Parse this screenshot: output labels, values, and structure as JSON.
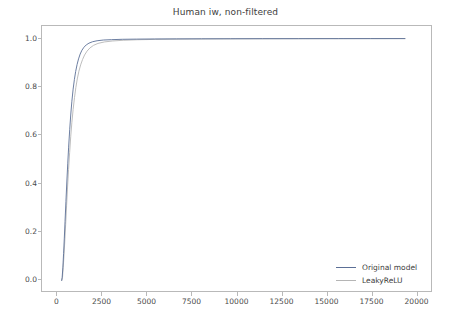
{
  "chart_data": {
    "type": "line",
    "title": "Human iw, non-filtered",
    "xlabel": "",
    "ylabel": "",
    "xlim": [
      -860,
      20860
    ],
    "ylim": [
      -0.052,
      1.052
    ],
    "grid": false,
    "legend_position": "lower right",
    "xticks": [
      0,
      2500,
      5000,
      7500,
      10000,
      12500,
      15000,
      17500,
      20000
    ],
    "xtick_labels": [
      "0",
      "2500",
      "5000",
      "7500",
      "10000",
      "12500",
      "15000",
      "17500",
      "20000"
    ],
    "yticks": [
      0.0,
      0.2,
      0.4,
      0.6,
      0.8,
      1.0
    ],
    "ytick_labels": [
      "0.0",
      "0.2",
      "0.4",
      "0.6",
      "0.8",
      "1.0"
    ],
    "series": [
      {
        "name": "Original model",
        "color": "#5b6f96",
        "x": [
          230,
          260,
          300,
          340,
          380,
          420,
          470,
          520,
          570,
          620,
          680,
          740,
          800,
          870,
          940,
          1010,
          1090,
          1170,
          1260,
          1360,
          1470,
          1600,
          1750,
          1950,
          2200,
          2550,
          3000,
          3600,
          4400,
          5400,
          6600,
          8000,
          9600,
          11400,
          13400,
          15600,
          17400,
          19300
        ],
        "y": [
          0.0,
          0.012,
          0.055,
          0.112,
          0.175,
          0.243,
          0.327,
          0.407,
          0.482,
          0.551,
          0.625,
          0.688,
          0.741,
          0.791,
          0.831,
          0.864,
          0.893,
          0.916,
          0.936,
          0.952,
          0.964,
          0.974,
          0.981,
          0.987,
          0.991,
          0.994,
          0.9955,
          0.997,
          0.9978,
          0.9984,
          0.9988,
          0.9991,
          0.9994,
          0.9996,
          0.9997,
          0.9998,
          0.9999,
          1.0
        ]
      },
      {
        "name": "LeakyReLU",
        "color": "#b5b5b5",
        "x": [
          245,
          280,
          320,
          365,
          410,
          455,
          505,
          560,
          615,
          675,
          735,
          800,
          870,
          945,
          1020,
          1100,
          1190,
          1285,
          1390,
          1505,
          1640,
          1800,
          2000,
          2250,
          2600,
          3050,
          3650,
          4450,
          5450,
          6700,
          8200,
          9900,
          11800,
          13800,
          15900,
          17600,
          19300
        ],
        "y": [
          0.0,
          0.014,
          0.054,
          0.108,
          0.168,
          0.232,
          0.308,
          0.386,
          0.458,
          0.528,
          0.594,
          0.654,
          0.707,
          0.756,
          0.797,
          0.833,
          0.865,
          0.891,
          0.913,
          0.932,
          0.948,
          0.961,
          0.972,
          0.98,
          0.986,
          0.99,
          0.993,
          0.9952,
          0.9966,
          0.9976,
          0.9983,
          0.9988,
          0.9992,
          0.9995,
          0.9997,
          0.9998,
          1.0
        ]
      }
    ]
  },
  "legend": {
    "entries": [
      {
        "label": "Original model",
        "color": "#5b6f96"
      },
      {
        "label": "LeakyReLU",
        "color": "#b5b5b5"
      }
    ]
  },
  "axes": {
    "frame_color": "#b9b9b9",
    "tick_color": "#4a4a4a"
  }
}
